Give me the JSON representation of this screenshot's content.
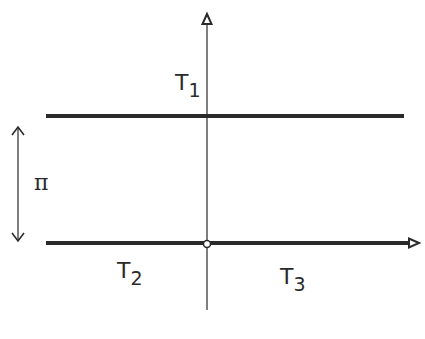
{
  "diagram": {
    "title": "",
    "labels": {
      "t1": {
        "base": "T",
        "sub": "1"
      },
      "t2": {
        "base": "T",
        "sub": "2"
      },
      "t3": {
        "base": "T",
        "sub": "3"
      },
      "gap": "π"
    },
    "elements": {
      "vertical_axis": "arrow pointing up",
      "horizontal_axis": "arrow pointing right",
      "upper_line": "thick horizontal line",
      "origin_marker": "open circle"
    },
    "colors": {
      "stroke": "#2a2a2a",
      "background": "#ffffff"
    }
  }
}
